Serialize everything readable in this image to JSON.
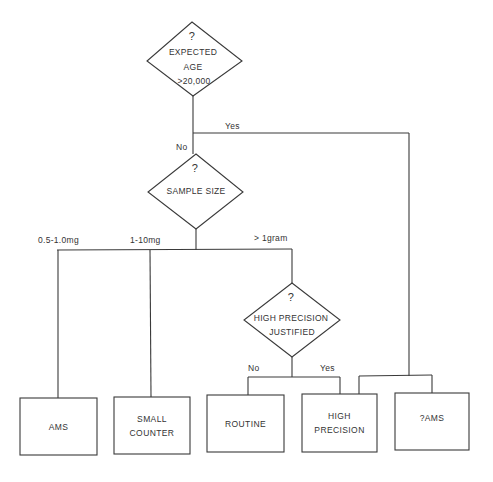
{
  "diagram": {
    "type": "flowchart",
    "colors": {
      "line": "#3a3a3a",
      "text": "#333333",
      "background": "#ffffff"
    },
    "decisions": [
      {
        "id": "expected-age",
        "lines": [
          "?",
          "EXPECTED",
          "AGE",
          ">20,000"
        ]
      },
      {
        "id": "sample-size",
        "lines": [
          "?",
          "SAMPLE SIZE"
        ]
      },
      {
        "id": "high-precision-justified",
        "lines": [
          "?",
          "HIGH PRECISION",
          "JUSTIFIED"
        ]
      }
    ],
    "edge_labels": {
      "age_no": "No",
      "age_yes": "Yes",
      "size_small": "0.5-1.0mg",
      "size_medium": "1-10mg",
      "size_large": "> 1gram",
      "precision_no": "No",
      "precision_yes": "Yes"
    },
    "outcomes": [
      {
        "id": "ams",
        "lines": [
          "AMS"
        ]
      },
      {
        "id": "small-counter",
        "lines": [
          "SMALL",
          "COUNTER"
        ]
      },
      {
        "id": "routine",
        "lines": [
          "ROUTINE"
        ]
      },
      {
        "id": "high-precision",
        "lines": [
          "HIGH",
          "PRECISION"
        ]
      },
      {
        "id": "q-ams",
        "lines": [
          "?AMS"
        ]
      }
    ]
  }
}
